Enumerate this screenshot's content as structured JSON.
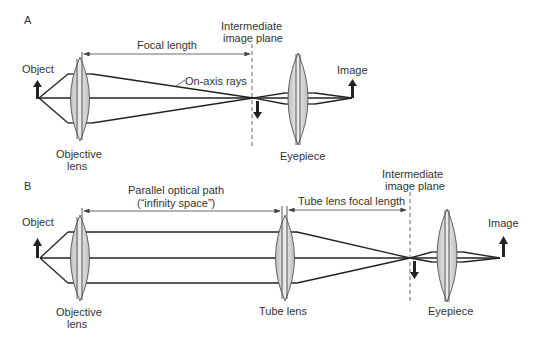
{
  "panel_a": {
    "label": "A",
    "object_label": "Object",
    "objective_label_line1": "Objective",
    "objective_label_line2": "lens",
    "focal_length_label": "Focal length",
    "on_axis_rays_label": "On-axis rays",
    "intermediate_label_line1": "Intermediate",
    "intermediate_label_line2": "image plane",
    "eyepiece_label": "Eyepiece",
    "image_label": "Image"
  },
  "panel_b": {
    "label": "B",
    "object_label": "Object",
    "objective_label_line1": "Objective",
    "objective_label_line2": "lens",
    "parallel_path_label_line1": "Parallel optical path",
    "parallel_path_label_line2": "(“infinity space”)",
    "tube_lens_focal_label": "Tube lens focal length",
    "intermediate_label_line1": "Intermediate",
    "intermediate_label_line2": "image plane",
    "tube_lens_label": "Tube lens",
    "eyepiece_label": "Eyepiece",
    "image_label": "Image"
  }
}
